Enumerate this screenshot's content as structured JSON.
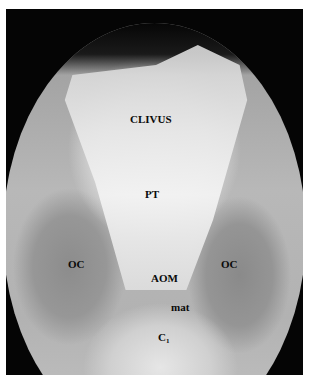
{
  "image": {
    "subject": "endoscopic anatomical view of clivus region",
    "background_color": "#050505",
    "frame_color": "#ffffff"
  },
  "labels": {
    "clivus": "CLIVUS",
    "pt": "PT",
    "oc_left": "OC",
    "oc_right": "OC",
    "aom": "AOM",
    "mat": "mat",
    "c1_main": "C",
    "c1_sub": "1"
  }
}
